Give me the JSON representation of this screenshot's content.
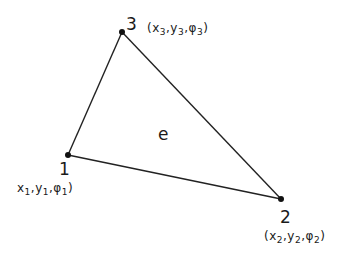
{
  "diagram": {
    "type": "triangular-finite-element",
    "element_label": "e",
    "stroke_color": "#222222",
    "background": "#ffffff",
    "nodes": [
      {
        "id": "1",
        "x": 68,
        "y": 155,
        "number_label": "1",
        "coords": {
          "x": "x",
          "x_sub": "1",
          "y": "y",
          "y_sub": "1",
          "phi": "φ",
          "phi_sub": "1",
          "open": "",
          "close": ")"
        }
      },
      {
        "id": "2",
        "x": 281,
        "y": 199,
        "number_label": "2",
        "coords": {
          "x": "x",
          "x_sub": "2",
          "y": "y",
          "y_sub": "2",
          "phi": "φ",
          "phi_sub": "2",
          "open": "(",
          "close": ")"
        }
      },
      {
        "id": "3",
        "x": 122,
        "y": 32,
        "number_label": "3",
        "coords": {
          "x": "x",
          "x_sub": "3",
          "y": "y",
          "y_sub": "3",
          "phi": "φ",
          "phi_sub": "3",
          "open": "(",
          "close": ")"
        }
      }
    ],
    "edges": [
      {
        "from": "1",
        "to": "2"
      },
      {
        "from": "2",
        "to": "3"
      },
      {
        "from": "3",
        "to": "1"
      }
    ]
  }
}
